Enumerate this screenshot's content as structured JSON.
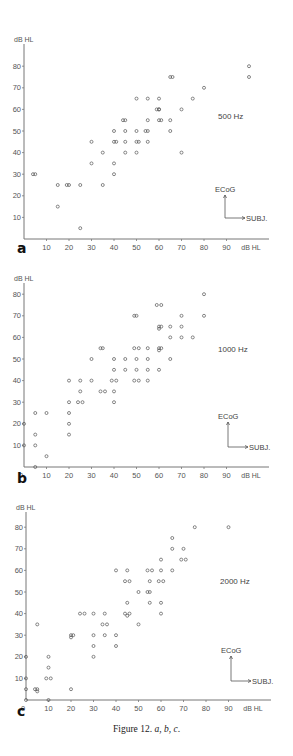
{
  "figure": {
    "caption_prefix": "Figure 12.",
    "caption_parts": [
      "a",
      "b",
      "c"
    ],
    "caption_text": "Figure 12. a, b, c."
  },
  "panels": [
    {
      "letter": "a",
      "freq_label": "500  Hz",
      "y_unit": "dB HL",
      "x_unit": "dB HL",
      "legend_y": "ECoG",
      "legend_x": "SUBJ."
    },
    {
      "letter": "b",
      "freq_label": "1000  Hz",
      "y_unit": "dB HL",
      "x_unit": "dB HL",
      "legend_y": "ECoG",
      "legend_x": "SUBJ."
    },
    {
      "letter": "c",
      "freq_label": "2000  Hz",
      "y_unit": "dB HL",
      "x_unit": "dB HL",
      "legend_y": "ECoG",
      "legend_x": "SUBJ."
    }
  ],
  "chart_data": [
    {
      "type": "scatter",
      "title": "500 Hz",
      "panel": "a",
      "xlabel": "SUBJ. (dB HL)",
      "ylabel": "ECoG (dB HL)",
      "xlim": [
        0,
        100
      ],
      "ylim": [
        0,
        90
      ],
      "x_ticks": [
        0,
        10,
        20,
        30,
        40,
        50,
        60,
        70,
        80,
        90
      ],
      "y_ticks": [
        10,
        20,
        30,
        40,
        50,
        60,
        70,
        80
      ],
      "grid": false,
      "legend": "arrow legend: ECoG (vertical), SUBJ. (horizontal)",
      "points": [
        [
          4,
          30
        ],
        [
          5,
          30
        ],
        [
          15,
          25
        ],
        [
          15,
          15
        ],
        [
          19,
          25
        ],
        [
          20,
          25
        ],
        [
          25,
          25
        ],
        [
          25,
          5
        ],
        [
          30,
          35
        ],
        [
          30,
          45
        ],
        [
          35,
          40
        ],
        [
          35,
          25
        ],
        [
          40,
          50
        ],
        [
          40,
          45
        ],
        [
          41,
          45
        ],
        [
          40,
          35
        ],
        [
          40,
          30
        ],
        [
          44,
          55
        ],
        [
          45,
          55
        ],
        [
          45,
          50
        ],
        [
          45,
          45
        ],
        [
          45,
          40
        ],
        [
          50,
          65
        ],
        [
          50,
          50
        ],
        [
          50,
          45
        ],
        [
          51,
          45
        ],
        [
          50,
          40
        ],
        [
          55,
          65
        ],
        [
          55,
          55
        ],
        [
          54,
          50
        ],
        [
          55,
          50
        ],
        [
          55,
          45
        ],
        [
          60,
          65
        ],
        [
          59,
          60
        ],
        [
          60,
          60
        ],
        [
          60,
          60
        ],
        [
          60,
          55
        ],
        [
          61,
          55
        ],
        [
          65,
          75
        ],
        [
          66,
          75
        ],
        [
          65,
          55
        ],
        [
          65,
          50
        ],
        [
          70,
          60
        ],
        [
          70,
          40
        ],
        [
          75,
          65
        ],
        [
          80,
          70
        ],
        [
          100,
          80
        ],
        [
          100,
          75
        ]
      ]
    },
    {
      "type": "scatter",
      "title": "1000 Hz",
      "panel": "b",
      "xlabel": "SUBJ. (dB HL)",
      "ylabel": "ECoG (dB HL)",
      "xlim": [
        0,
        100
      ],
      "ylim": [
        0,
        90
      ],
      "x_ticks": [
        0,
        10,
        20,
        30,
        40,
        50,
        60,
        70,
        80,
        90
      ],
      "y_ticks": [
        10,
        20,
        30,
        40,
        50,
        60,
        70,
        80
      ],
      "grid": false,
      "legend": "arrow legend: ECoG (vertical), SUBJ. (horizontal)",
      "points": [
        [
          0,
          20
        ],
        [
          0,
          10
        ],
        [
          5,
          25
        ],
        [
          5,
          15
        ],
        [
          5,
          10
        ],
        [
          5,
          0
        ],
        [
          10,
          25
        ],
        [
          10,
          5
        ],
        [
          20,
          40
        ],
        [
          20,
          30
        ],
        [
          20,
          25
        ],
        [
          20,
          20
        ],
        [
          20,
          15
        ],
        [
          25,
          40
        ],
        [
          25,
          35
        ],
        [
          24,
          30
        ],
        [
          26,
          30
        ],
        [
          30,
          50
        ],
        [
          30,
          40
        ],
        [
          34,
          55
        ],
        [
          35,
          55
        ],
        [
          34,
          35
        ],
        [
          36,
          35
        ],
        [
          40,
          50
        ],
        [
          40,
          45
        ],
        [
          39,
          40
        ],
        [
          41,
          40
        ],
        [
          40,
          35
        ],
        [
          40,
          30
        ],
        [
          45,
          50
        ],
        [
          45,
          45
        ],
        [
          49,
          70
        ],
        [
          50,
          70
        ],
        [
          49,
          55
        ],
        [
          51,
          55
        ],
        [
          50,
          50
        ],
        [
          50,
          45
        ],
        [
          49,
          40
        ],
        [
          51,
          40
        ],
        [
          55,
          55
        ],
        [
          55,
          50
        ],
        [
          55,
          45
        ],
        [
          55,
          40
        ],
        [
          59,
          75
        ],
        [
          61,
          75
        ],
        [
          60,
          65
        ],
        [
          61,
          65
        ],
        [
          60,
          64
        ],
        [
          60,
          55
        ],
        [
          61,
          55
        ],
        [
          60,
          54
        ],
        [
          60,
          45
        ],
        [
          65,
          65
        ],
        [
          65,
          60
        ],
        [
          65,
          50
        ],
        [
          70,
          70
        ],
        [
          70,
          65
        ],
        [
          70,
          60
        ],
        [
          75,
          60
        ],
        [
          80,
          80
        ],
        [
          80,
          70
        ]
      ]
    },
    {
      "type": "scatter",
      "title": "2000 Hz",
      "panel": "c",
      "xlabel": "SUBJ. (dB HL)",
      "ylabel": "ECoG (dB HL)",
      "xlim": [
        0,
        100
      ],
      "ylim": [
        0,
        90
      ],
      "x_ticks": [
        0,
        10,
        20,
        30,
        40,
        50,
        60,
        70,
        80,
        90
      ],
      "y_ticks": [
        10,
        20,
        30,
        40,
        50,
        60,
        70,
        80
      ],
      "grid": false,
      "legend": "arrow legend: ECoG (vertical), SUBJ. (horizontal)",
      "points": [
        [
          0,
          20
        ],
        [
          0,
          10
        ],
        [
          0,
          5
        ],
        [
          0,
          0
        ],
        [
          4,
          5
        ],
        [
          5,
          5
        ],
        [
          5,
          4
        ],
        [
          5,
          35
        ],
        [
          10,
          20
        ],
        [
          10,
          15
        ],
        [
          9,
          10
        ],
        [
          11,
          10
        ],
        [
          10,
          0
        ],
        [
          20,
          30
        ],
        [
          20,
          29
        ],
        [
          21,
          30
        ],
        [
          20,
          5
        ],
        [
          24,
          40
        ],
        [
          26,
          40
        ],
        [
          30,
          40
        ],
        [
          30,
          30
        ],
        [
          30,
          25
        ],
        [
          30,
          20
        ],
        [
          35,
          40
        ],
        [
          34,
          35
        ],
        [
          36,
          35
        ],
        [
          35,
          30
        ],
        [
          40,
          60
        ],
        [
          40,
          30
        ],
        [
          40,
          25
        ],
        [
          45,
          60
        ],
        [
          44,
          55
        ],
        [
          46,
          55
        ],
        [
          45,
          45
        ],
        [
          44,
          40
        ],
        [
          46,
          40
        ],
        [
          45,
          39
        ],
        [
          50,
          50
        ],
        [
          50,
          35
        ],
        [
          54,
          60
        ],
        [
          56,
          60
        ],
        [
          55,
          55
        ],
        [
          54,
          50
        ],
        [
          55,
          50
        ],
        [
          55,
          45
        ],
        [
          60,
          65
        ],
        [
          60,
          60
        ],
        [
          59,
          55
        ],
        [
          61,
          55
        ],
        [
          60,
          45
        ],
        [
          60,
          40
        ],
        [
          65,
          75
        ],
        [
          65,
          70
        ],
        [
          65,
          60
        ],
        [
          70,
          70
        ],
        [
          69,
          65
        ],
        [
          71,
          65
        ],
        [
          75,
          80
        ],
        [
          90,
          80
        ]
      ]
    }
  ]
}
